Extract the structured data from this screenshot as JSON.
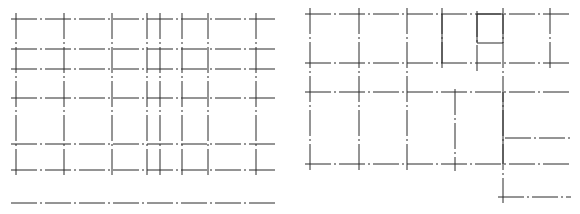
{
  "drawing": {
    "width": 580,
    "height": 214,
    "background": "#ffffff",
    "line_color": "#2a2a2a",
    "left_grid": {
      "horizontal_lines": [
        {
          "y": 19,
          "x1": 11,
          "x2": 278,
          "style": "dashdot"
        },
        {
          "y": 49,
          "x1": 11,
          "x2": 278,
          "style": "dashdot"
        },
        {
          "y": 69,
          "x1": 11,
          "x2": 278,
          "style": "dashdot"
        },
        {
          "y": 98,
          "x1": 11,
          "x2": 278,
          "style": "dashdot"
        },
        {
          "y": 144,
          "x1": 11,
          "x2": 278,
          "style": "dashdot"
        },
        {
          "y": 170,
          "x1": 11,
          "x2": 278,
          "style": "dashdot"
        },
        {
          "y": 203,
          "x1": 11,
          "x2": 278,
          "style": "dashdot"
        }
      ],
      "vertical_lines": [
        {
          "x": 16,
          "y1": 13,
          "y2": 178,
          "style": "dashdot"
        },
        {
          "x": 64,
          "y1": 13,
          "y2": 178,
          "style": "dashdot"
        },
        {
          "x": 112,
          "y1": 13,
          "y2": 178,
          "style": "dashdot"
        },
        {
          "x": 147,
          "y1": 13,
          "y2": 178,
          "style": "dashdot"
        },
        {
          "x": 160,
          "y1": 13,
          "y2": 178,
          "style": "dashdot"
        },
        {
          "x": 182,
          "y1": 13,
          "y2": 178,
          "style": "dashdot"
        },
        {
          "x": 208,
          "y1": 13,
          "y2": 178,
          "style": "dashdot"
        },
        {
          "x": 256,
          "y1": 13,
          "y2": 178,
          "style": "dashdot"
        }
      ]
    },
    "right_grid": {
      "horizontal_lines": [
        {
          "y": 14,
          "x1": 305,
          "x2": 571,
          "style": "dashdot"
        },
        {
          "y": 63,
          "x1": 305,
          "x2": 571,
          "style": "dashdot"
        },
        {
          "y": 92,
          "x1": 305,
          "x2": 571,
          "style": "dashdot"
        },
        {
          "y": 138,
          "x1": 505,
          "x2": 571,
          "style": "dashdot"
        },
        {
          "y": 164,
          "x1": 305,
          "x2": 571,
          "style": "dashdot"
        },
        {
          "y": 197,
          "x1": 498,
          "x2": 571,
          "style": "dashdot"
        }
      ],
      "vertical_lines": [
        {
          "x": 310,
          "y1": 8,
          "y2": 171,
          "style": "dashdot"
        },
        {
          "x": 359,
          "y1": 8,
          "y2": 171,
          "style": "dashdot"
        },
        {
          "x": 407,
          "y1": 8,
          "y2": 171,
          "style": "dashdot"
        },
        {
          "x": 442,
          "y1": 8,
          "y2": 69,
          "style": "dashdot"
        },
        {
          "x": 455,
          "y1": 89,
          "y2": 171,
          "style": "dashdot"
        },
        {
          "x": 477,
          "y1": 11,
          "y2": 71,
          "style": "dashdot"
        },
        {
          "x": 503,
          "y1": 8,
          "y2": 203,
          "style": "dashdot"
        },
        {
          "x": 550,
          "y1": 8,
          "y2": 69,
          "style": "dashdot"
        }
      ],
      "solid_segments": [
        {
          "x1": 442,
          "y1": 14,
          "x2": 442,
          "y2": 63
        },
        {
          "x1": 477,
          "y1": 14,
          "x2": 477,
          "y2": 43
        },
        {
          "x1": 477,
          "y1": 43,
          "x2": 503,
          "y2": 43
        },
        {
          "x1": 503,
          "y1": 14,
          "x2": 503,
          "y2": 43
        },
        {
          "x1": 477,
          "y1": 14,
          "x2": 503,
          "y2": 14
        },
        {
          "x1": 503,
          "y1": 92,
          "x2": 503,
          "y2": 164
        }
      ]
    }
  }
}
